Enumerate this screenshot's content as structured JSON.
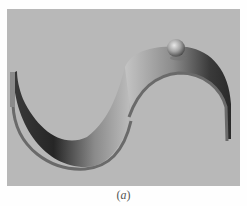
{
  "figure": {
    "caption_open": "(",
    "caption_label": "a",
    "caption_close": ")",
    "scene": {
      "description": "3D rendering of an S-shaped curved track (rail) with a sphere resting near the top of the right arc",
      "background_color": "#b8b8b8",
      "track_light_color": "#c2c2c2",
      "track_dark_color": "#2e2e2e",
      "ball_color": "#9a9a9a"
    }
  }
}
